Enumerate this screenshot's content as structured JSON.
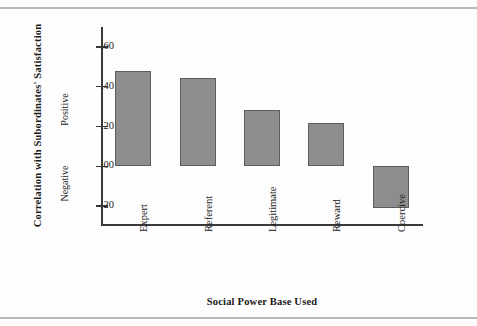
{
  "chart_data": {
    "type": "bar",
    "title": "",
    "xlabel": "Social Power Base Used",
    "ylabel": "Correlation with Subordinates' Satisfaction",
    "categories": [
      "Expert",
      "Referent",
      "Legitimate",
      "Reward",
      "Coercive"
    ],
    "values": [
      0.48,
      0.445,
      0.285,
      0.22,
      -0.21
    ],
    "ylim": [
      -0.3,
      0.7
    ],
    "yticks": [
      0.6,
      0.4,
      0.2,
      0.0,
      -0.2
    ],
    "ytick_labels": [
      ".60",
      ".40",
      ".20",
      ".00",
      "-.20"
    ],
    "grid": false,
    "legend": null,
    "annotations": {
      "positive_label": "Positive",
      "negative_label": "Negative",
      "zero_reference_line": 0.0
    },
    "bar_color": "#8d8d8d",
    "bar_edge_color": "#5d5d5d",
    "axis_color": "#3a3a3a"
  }
}
